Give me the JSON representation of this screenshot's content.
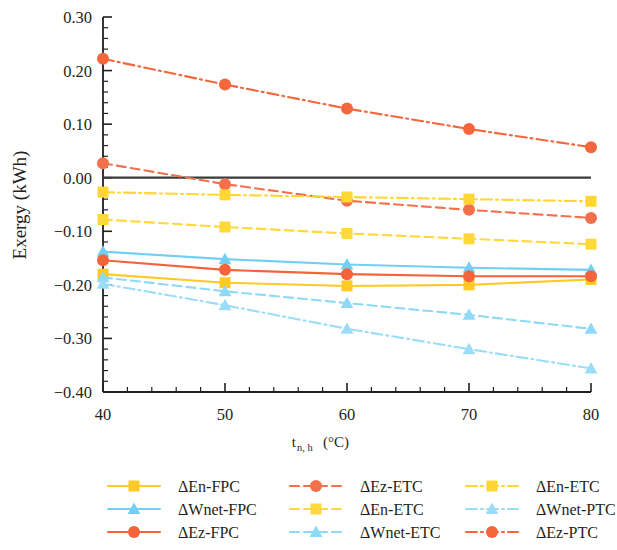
{
  "chart_data": {
    "type": "line",
    "title": "",
    "xlabel": "t_{n, h} (°C)",
    "xlabel_main": "t",
    "xlabel_sub": "n, h",
    "xlabel_unit": "(°C)",
    "ylabel": "Exergy (kWh)",
    "x": [
      40,
      50,
      60,
      70,
      80
    ],
    "xlim": [
      40,
      80
    ],
    "ylim": [
      -0.4,
      0.3
    ],
    "xticks": [
      40,
      50,
      60,
      70,
      80
    ],
    "xtick_labels": [
      "40",
      "50",
      "60",
      "70",
      "80"
    ],
    "yticks": [
      0.3,
      0.2,
      0.1,
      0.0,
      -0.1,
      -0.2,
      -0.3,
      -0.4
    ],
    "ytick_labels": [
      "0.30",
      "0.20",
      "0.10",
      "0.00",
      "-0.10",
      "-0.20",
      "-0.30",
      "-0.40"
    ],
    "grid": false,
    "zero_line": true,
    "legend_position": "bottom",
    "legend_columns": 3,
    "series": [
      {
        "name": "ΔEn-FPC",
        "values": [
          -0.18,
          -0.196,
          -0.202,
          -0.2,
          -0.19
        ],
        "color": "#FFC926",
        "marker": "square",
        "dash": "solid"
      },
      {
        "name": "ΔWnet-FPC",
        "values": [
          -0.138,
          -0.152,
          -0.162,
          -0.168,
          -0.172
        ],
        "color": "#72CFF4",
        "marker": "triangle",
        "dash": "solid"
      },
      {
        "name": "ΔEz-FPC",
        "values": [
          -0.154,
          -0.172,
          -0.18,
          -0.184,
          -0.184
        ],
        "color": "#F4633A",
        "marker": "circle",
        "dash": "solid"
      },
      {
        "name": "ΔEz-ETC",
        "values": [
          0.027,
          -0.012,
          -0.043,
          -0.06,
          -0.075
        ],
        "color": "#F2704A",
        "marker": "circle",
        "dash": "dashed"
      },
      {
        "name": "ΔEn-ETC",
        "values": [
          -0.078,
          -0.092,
          -0.104,
          -0.114,
          -0.124
        ],
        "color": "#FFD83A",
        "marker": "square",
        "dash": "dashed"
      },
      {
        "name": "ΔWnet-ETC",
        "values": [
          -0.186,
          -0.212,
          -0.234,
          -0.256,
          -0.282
        ],
        "color": "#8ED8F8",
        "marker": "triangle",
        "dash": "dashed"
      },
      {
        "name": "ΔEn-ETC2",
        "values": [
          -0.027,
          -0.032,
          -0.036,
          -0.04,
          -0.044
        ],
        "color": "#FFD633",
        "marker": "square",
        "dash": "dashdot"
      },
      {
        "name": "ΔWnet-PTC",
        "values": [
          -0.198,
          -0.238,
          -0.282,
          -0.32,
          -0.356
        ],
        "color": "#9BDDF8",
        "marker": "triangle",
        "dash": "dashdot"
      },
      {
        "name": "ΔEz-PTC",
        "values": [
          0.222,
          0.174,
          0.129,
          0.091,
          0.057
        ],
        "color": "#F4663C",
        "marker": "circle",
        "dash": "dashdot"
      }
    ]
  },
  "legend": {
    "columns": [
      {
        "items": [
          {
            "label": "ΔEn-FPC",
            "series_index": 0
          },
          {
            "label": "ΔWnet-FPC",
            "series_index": 1
          },
          {
            "label": "ΔEz-FPC",
            "series_index": 2
          }
        ]
      },
      {
        "items": [
          {
            "label": "ΔEz-ETC",
            "series_index": 3
          },
          {
            "label": "ΔEn-ETC",
            "series_index": 4
          },
          {
            "label": "ΔWnet-ETC",
            "series_index": 5
          }
        ]
      },
      {
        "items": [
          {
            "label": "ΔEn-ETC",
            "series_index": 6
          },
          {
            "label": "ΔWnet-PTC",
            "series_index": 7
          },
          {
            "label": "ΔEz-PTC",
            "series_index": 8
          }
        ]
      }
    ]
  },
  "colors": {
    "axis": "#231f20",
    "zero_line": "#3a3a3a",
    "background": "#ffffff",
    "gold": "#FFC926",
    "sky": "#72CFF4",
    "orange": "#F4633A"
  }
}
